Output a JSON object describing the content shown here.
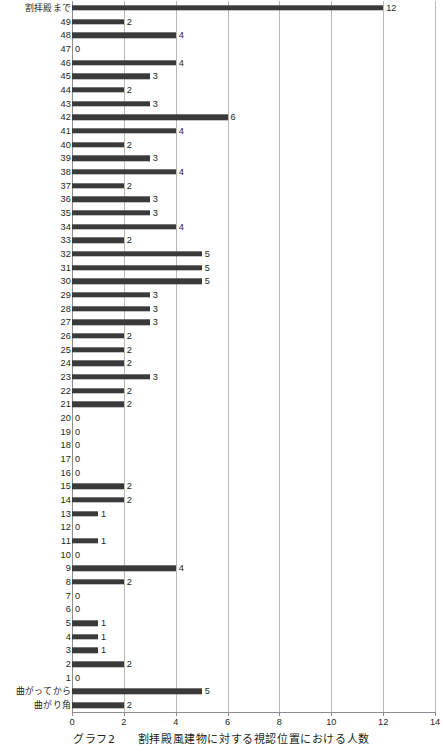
{
  "caption": {
    "prefix": "グラフ2",
    "text": "割拝殿風建物に対する視認位置における人数"
  },
  "chart_data": {
    "type": "bar",
    "orientation": "horizontal",
    "xlabel": "",
    "ylabel": "",
    "xlim": [
      0,
      14
    ],
    "xticks": [
      0,
      2,
      4,
      6,
      8,
      10,
      12,
      14
    ],
    "xtick_labels": [
      "0",
      "2",
      "4",
      "6",
      "8",
      "10",
      "12",
      "14"
    ],
    "grid": true,
    "legend": false,
    "bar_color": "#3a3a3a",
    "data_labels": true,
    "categories": [
      "割拝殿まで",
      "49",
      "48",
      "47",
      "46",
      "45",
      "44",
      "43",
      "42",
      "41",
      "40",
      "39",
      "38",
      "37",
      "36",
      "35",
      "34",
      "33",
      "32",
      "31",
      "30",
      "29",
      "28",
      "27",
      "26",
      "25",
      "24",
      "23",
      "22",
      "21",
      "20",
      "19",
      "18",
      "17",
      "16",
      "15",
      "14",
      "13",
      "12",
      "11",
      "10",
      "9",
      "8",
      "7",
      "6",
      "5",
      "4",
      "3",
      "2",
      "1",
      "曲がってから",
      "曲がり角"
    ],
    "values": [
      12,
      2,
      4,
      0,
      4,
      3,
      2,
      3,
      6,
      4,
      2,
      3,
      4,
      2,
      3,
      3,
      4,
      2,
      5,
      5,
      5,
      3,
      3,
      3,
      2,
      2,
      2,
      3,
      2,
      2,
      0,
      0,
      0,
      0,
      0,
      2,
      2,
      1,
      0,
      1,
      0,
      4,
      2,
      0,
      0,
      1,
      1,
      1,
      2,
      0,
      5,
      2
    ]
  }
}
